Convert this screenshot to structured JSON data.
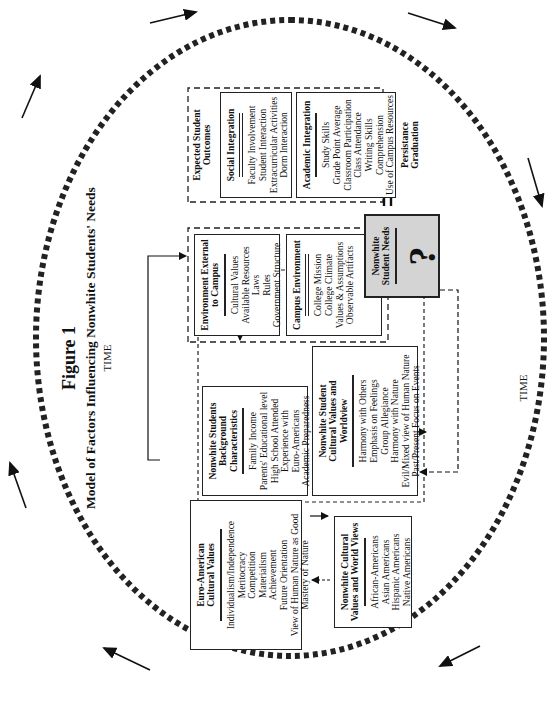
{
  "figure": {
    "title": "Figure 1",
    "subtitle": "Model of Factors Influencing Nonwhite Students' Needs",
    "time_label_top": "TIME",
    "time_label_bottom": "TIME"
  },
  "boxes": {
    "euro_american": {
      "title": "Euro-American Cultural Values",
      "items": [
        "Individualism/Independence",
        "Meritocracy",
        "Competition",
        "Materialism",
        "Achievement",
        "Future Orientation",
        "View of Human Nature as Good",
        "Mastery of Nature"
      ]
    },
    "nonwhite_cultural": {
      "title": "Nonwhite Cultural Values and World Views",
      "items": [
        "African-Americans",
        "Asian Americans",
        "Hispanic Americans",
        "Native Americans"
      ]
    },
    "background": {
      "title": "Nonwhite Students Background Characteristics",
      "items": [
        "Family Income",
        "Parents' Educational level",
        "High School Attended",
        "Experience with",
        "Euro-Americans",
        "Academic Preparedness"
      ]
    },
    "student_worldview": {
      "title": "Nonwhite Student Cultural Values and Worldview",
      "items": [
        "Harmony with Others",
        "Emphasis on Feelings",
        "Group Allegiance",
        "Harmony with Nature",
        "Evil/Mixed view of Human Nature",
        "Past/Present Focus on Events"
      ]
    },
    "external_env": {
      "title": "Environment External to Campus",
      "items": [
        "Cultural Values",
        "Available Resources",
        "Laws",
        "Rules",
        "Government Structure"
      ]
    },
    "campus_env": {
      "title": "Campus Environment",
      "items": [
        "College Mission",
        "College Climate",
        "Values & Assumptions",
        "Observable Artifacts"
      ]
    },
    "needs": {
      "title": "Nonwhite Student Needs",
      "symbol": "?"
    },
    "outcomes": {
      "title": "Expected Student Outcomes",
      "social": {
        "title": "Social Integration",
        "items": [
          "Faculty Involvement",
          "Student Interaction",
          "Extracurricular Activities",
          "Dorm Interaction"
        ]
      },
      "academic": {
        "title": "Academic Integration",
        "items": [
          "Study Skills",
          "Grade Point Average",
          "Classroom Participation",
          "Class Attendance",
          "Writing Skills",
          "Comprehension",
          "Use of Campus Resources"
        ]
      },
      "persistence": [
        "Persistance",
        "Graduation"
      ]
    }
  },
  "colors": {
    "line": "#222222",
    "needs_fill": "#d4d4d4",
    "background": "#ffffff"
  }
}
